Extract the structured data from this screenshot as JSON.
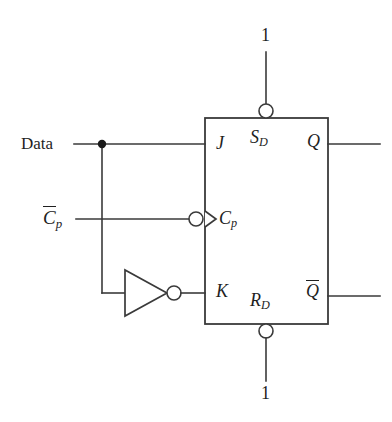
{
  "diagram": {
    "type": "logic-circuit-schematic",
    "stroke_color": "#3a3a3a",
    "text_color": "#1f1f1f",
    "background": "#ffffff"
  },
  "labels": {
    "data_input": "Data",
    "clock_input_base": "C",
    "clock_input_sub": "p",
    "clock_input_overbar": true,
    "input_j": "J",
    "input_k": "K",
    "input_cp_base": "C",
    "input_cp_sub": "p",
    "preset_base": "S",
    "preset_sub": "D",
    "clear_base": "R",
    "clear_sub": "D",
    "output_q": "Q",
    "output_qbar": "Q",
    "output_qbar_overbar": true,
    "logic_one_top": "1",
    "logic_one_bottom": "1"
  },
  "components": [
    {
      "name": "flip-flop-body",
      "kind": "rectangle",
      "x": 205,
      "y": 118,
      "width": 123,
      "height": 206
    },
    {
      "name": "inverter-gate",
      "kind": "triangle-with-bubble",
      "apex_x": 167,
      "apex_y": 293,
      "back_x": 125,
      "top_y": 270,
      "bottom_y": 316,
      "bubble_cx": 174,
      "bubble_cy": 293,
      "bubble_r": 7
    },
    {
      "name": "clock-dynamic-indicator",
      "kind": "triangle",
      "x": 205,
      "y": 219,
      "size": 12
    },
    {
      "name": "clock-inversion-bubble",
      "kind": "bubble",
      "cx": 196,
      "cy": 219,
      "r": 7
    },
    {
      "name": "preset-active-low-bubble",
      "kind": "bubble",
      "cx": 266,
      "cy": 111,
      "r": 7
    },
    {
      "name": "clear-active-low-bubble",
      "kind": "bubble",
      "cx": 266,
      "cy": 331,
      "r": 7
    },
    {
      "name": "data-junction-dot",
      "kind": "junction",
      "cx": 102,
      "cy": 144,
      "r": 4
    }
  ],
  "nets": [
    {
      "name": "data-to-j",
      "from": "Data",
      "to": "J",
      "y": 144
    },
    {
      "name": "data-branch-down",
      "from": "data-junction-dot",
      "to": "inverter-input",
      "x": 102
    },
    {
      "name": "cpbar-to-clock",
      "from": "Cp-bar",
      "to": "Cp",
      "y": 219
    },
    {
      "name": "inverter-to-k",
      "from": "inverter-output",
      "to": "K",
      "y": 293
    },
    {
      "name": "one-to-preset",
      "from": "1",
      "to": "SD",
      "x": 266
    },
    {
      "name": "one-to-clear",
      "from": "1",
      "to": "RD",
      "x": 266
    },
    {
      "name": "q-output",
      "from": "Q",
      "to": "open",
      "y": 144
    },
    {
      "name": "qbar-output",
      "from": "Q-bar",
      "to": "open",
      "y": 296
    }
  ]
}
